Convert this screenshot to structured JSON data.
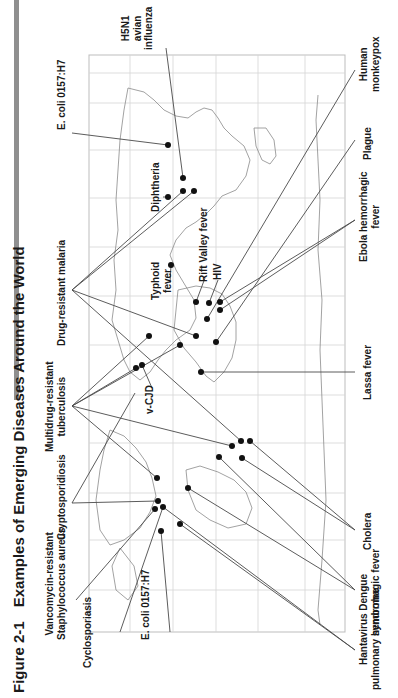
{
  "figure": {
    "number": "Figure 2-1",
    "title": "Examples of Emerging Diseases Around the World"
  },
  "labels": {
    "vrsa": [
      "Vancomycin-resistant",
      "Staphylococcus aureus"
    ],
    "cyclosporiasis": "Cyclosporiasis",
    "ecoli_americas": "E. coli 0157:H7",
    "cryptosporidiosis": "Cryptosporidiosis",
    "mdr_tb": [
      "Multidrug-resistant",
      "tuberculosis"
    ],
    "vcjd": "v-CJD",
    "drug_resistant_malaria": "Drug-resistant malaria",
    "typhoid": [
      "Typhoid",
      "fever"
    ],
    "rift_valley": "Rift Valley fever",
    "hiv": "HIV",
    "diphtheria": "Diphtheria",
    "ecoli_asia": "E. coli 0157:H7",
    "h5n1": [
      "H5N1",
      "avian",
      "influenza"
    ],
    "hantavirus": [
      "Hantavirus",
      "pulmonary syndrome"
    ],
    "dengue": [
      "Dengue",
      "hemorrhagic fever"
    ],
    "cholera": "Cholera",
    "lassa": "Lassa fever",
    "ebola": [
      "Ebola hemorrhagic",
      "fever"
    ],
    "plague": "Plague",
    "monkeypox": [
      "Human",
      "monkeypox"
    ]
  },
  "map": {
    "frame": {
      "x": 89,
      "y": 55,
      "w": 256,
      "h": 577
    },
    "grid_x": [
      130,
      173,
      216,
      258,
      305
    ],
    "grid_y": [
      103,
      150,
      198,
      247,
      296,
      345,
      395,
      443,
      493,
      540,
      590
    ],
    "line_color": "#4a4a4a",
    "grid_color": "#c8c8c8",
    "dot_color": "#111111"
  },
  "colors": {
    "title_bar": "#8f8f8f",
    "text": "#1a1a1a"
  }
}
